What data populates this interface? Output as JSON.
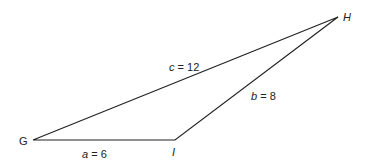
{
  "diagram": {
    "type": "triangle",
    "vertices": {
      "G": {
        "label": "G"
      },
      "H": {
        "label": "H"
      },
      "I": {
        "label": "I"
      }
    },
    "sides": {
      "a": {
        "var": "a",
        "eq": " = 6",
        "value": 6,
        "between": "G-I"
      },
      "b": {
        "var": "b",
        "eq": " = 8",
        "value": 8,
        "between": "I-H"
      },
      "c": {
        "var": "c",
        "eq": " = 12",
        "value": 12,
        "between": "G-H"
      }
    },
    "line_color": "#222222"
  }
}
